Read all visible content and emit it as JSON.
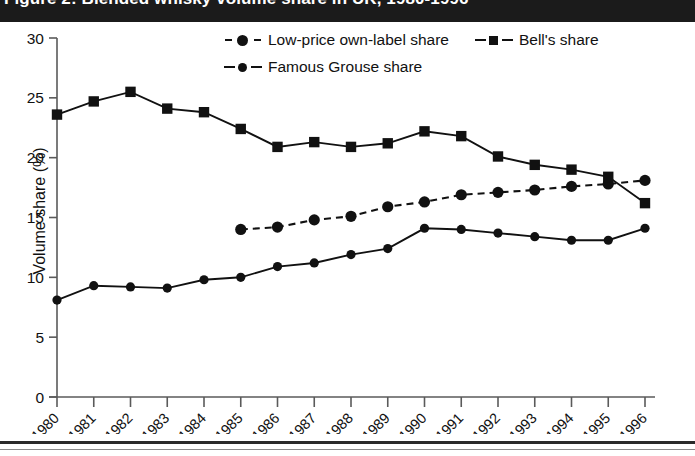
{
  "figure": {
    "title": "Figure 2: Blended whisky volume share in UK, 1980-1996"
  },
  "legend": {
    "position": "top",
    "rows": [
      [
        {
          "label": "Low-price own-label share",
          "marker": "circle",
          "line": "dashed"
        },
        {
          "label": "Bell's share",
          "marker": "square",
          "line": "solid"
        }
      ],
      [
        {
          "label": "Famous Grouse share",
          "marker": "circle",
          "line": "solid"
        }
      ]
    ]
  },
  "axes": {
    "y_title": "Volume share (%)",
    "y_ticks": [
      "0",
      "5",
      "10",
      "15",
      "20",
      "25",
      "30"
    ],
    "x_title": ""
  },
  "chart_data": {
    "type": "line",
    "title": "Figure 2: Blended whisky volume share in UK, 1980-1996",
    "xlabel": "",
    "ylabel": "Volume share (%)",
    "ylim": [
      0,
      30
    ],
    "yticks": [
      0,
      5,
      10,
      15,
      20,
      25,
      30
    ],
    "grid": false,
    "legend_position": "top",
    "categories": [
      "1980",
      "1981",
      "1982",
      "1983",
      "1984",
      "1985",
      "1986",
      "1987",
      "1988",
      "1989",
      "1990",
      "1991",
      "1992",
      "1993",
      "1994",
      "1995",
      "1996"
    ],
    "x": [
      1980,
      1981,
      1982,
      1983,
      1984,
      1985,
      1986,
      1987,
      1988,
      1989,
      1990,
      1991,
      1992,
      1993,
      1994,
      1995,
      1996
    ],
    "series": [
      {
        "name": "Low-price own-label share",
        "marker": "circle",
        "line": "dashed",
        "color": "#111111",
        "values": [
          null,
          null,
          null,
          null,
          null,
          14.0,
          14.2,
          14.8,
          15.1,
          15.9,
          16.3,
          16.9,
          17.1,
          17.3,
          17.6,
          17.8,
          18.1
        ]
      },
      {
        "name": "Bell's share",
        "marker": "square",
        "line": "solid",
        "color": "#111111",
        "values": [
          23.6,
          24.7,
          25.5,
          24.1,
          23.8,
          22.4,
          20.9,
          21.3,
          20.9,
          21.2,
          22.2,
          21.8,
          20.1,
          19.4,
          19.0,
          18.4,
          16.2
        ]
      },
      {
        "name": "Famous Grouse share",
        "marker": "circle",
        "line": "solid",
        "color": "#111111",
        "values": [
          8.1,
          9.3,
          9.2,
          9.1,
          9.8,
          10.0,
          10.9,
          11.2,
          11.9,
          12.4,
          14.1,
          14.0,
          13.7,
          13.4,
          13.1,
          13.1,
          14.1
        ]
      }
    ]
  }
}
